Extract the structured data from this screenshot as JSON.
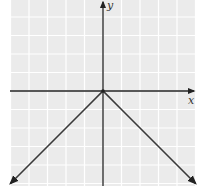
{
  "chart_data": {
    "type": "line",
    "title": "",
    "function": "y = -|x|",
    "xlabel": "x",
    "ylabel": "y",
    "xlim": [
      -5,
      5
    ],
    "ylim": [
      -5,
      5
    ],
    "grid": true,
    "legend": null,
    "series": [
      {
        "name": "y = -|x|",
        "x": [
          -5,
          -4,
          -3,
          -2,
          -1,
          0,
          1,
          2,
          3,
          4,
          5
        ],
        "y": [
          -5,
          -4,
          -3,
          -2,
          -1,
          0,
          -1,
          -2,
          -3,
          -4,
          -5
        ]
      }
    ],
    "annotations": [
      "arrowheads at both ends of the graph",
      "arrow on positive x-axis and positive y-axis"
    ]
  },
  "labels": {
    "x_axis": "x",
    "y_axis": "y"
  },
  "colors": {
    "grid_background": "#ebebeb",
    "grid_lines": "#ffffff",
    "axis": "#222222",
    "curve": "#3a3a3a"
  }
}
